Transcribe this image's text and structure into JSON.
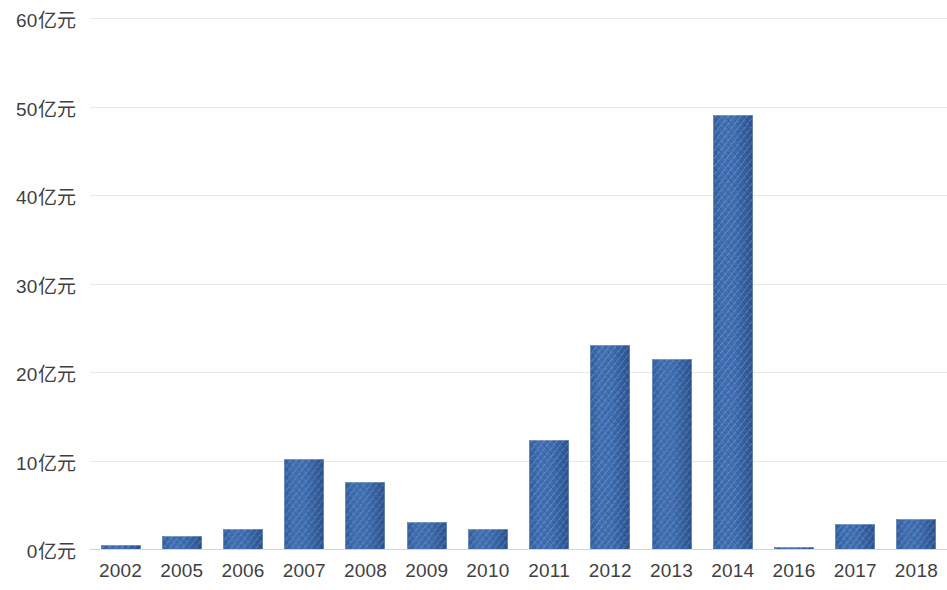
{
  "chart_data": {
    "type": "bar",
    "title": "",
    "subtitle": "",
    "xlabel": "",
    "ylabel": "",
    "unit_suffix": "亿元",
    "categories": [
      "2002",
      "2005",
      "2006",
      "2007",
      "2008",
      "2009",
      "2010",
      "2011",
      "2012",
      "2013",
      "2014",
      "2016",
      "2017",
      "2018"
    ],
    "values": [
      0.4,
      1.5,
      2.3,
      10.2,
      7.6,
      3.1,
      2.3,
      12.3,
      23.0,
      21.5,
      49.0,
      0.1,
      2.8,
      3.4
    ],
    "series": [
      {
        "name": "",
        "values": [
          0.4,
          1.5,
          2.3,
          10.2,
          7.6,
          3.1,
          2.3,
          12.3,
          23.0,
          21.5,
          49.0,
          0.1,
          2.8,
          3.4
        ]
      }
    ],
    "ylim": [
      0,
      60
    ],
    "y_tick_values": [
      60,
      50,
      40,
      30,
      20,
      10,
      0
    ],
    "y_tick_labels": [
      "60亿元",
      "50亿元",
      "40亿元",
      "30亿元",
      "20亿元",
      "10亿元",
      "0亿元"
    ],
    "grid": true,
    "grid_axis": "y",
    "legend": false,
    "legend_position": "none",
    "bar_color": "#3763a4",
    "gridline_color": "#e8e8ea",
    "axis_line_color": "#d4d4d8",
    "tick_label_color": "#3f3f42",
    "background_color": "#ffffff",
    "annotations": []
  }
}
